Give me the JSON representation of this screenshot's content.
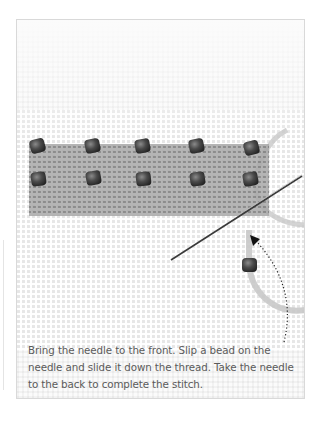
{
  "figure": {
    "caption": "Bring the needle to the front. Slip a bead on the needle and slide it down the thread. Take the needle to the back to complete the stitch.",
    "elements": {
      "canvas": "even-weave canvas grid",
      "stitched_band": "tent-stitched band with two rows of five beads",
      "needle": "needle-icon",
      "thread": "thread-loop",
      "loose_bead": "bead on thread",
      "arrow": "dotted-curved-arrow-icon"
    },
    "colors": {
      "background": "#ffffff",
      "canvas": "#fbfbfb",
      "band": "#9a9a9a",
      "bead": "#3a3a3a",
      "thread": "#c4c4c4",
      "caption_text": "#5a5a5a",
      "border": "#d9d9d9"
    }
  }
}
